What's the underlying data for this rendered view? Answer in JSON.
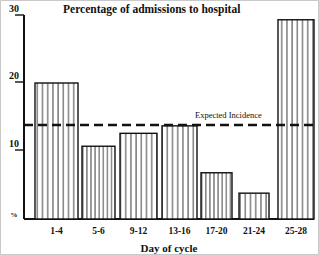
{
  "chart_data": {
    "type": "bar",
    "title": "Percentage of admissions to hospital",
    "xlabel": "Day of cycle",
    "ylabel": "%",
    "categories": [
      "1-4",
      "5-6",
      "9-12",
      "13-16",
      "17-20",
      "21-24",
      "25-28"
    ],
    "values": [
      20,
      10.7,
      12.6,
      13.7,
      6.8,
      3.8,
      29.3
    ],
    "ylim": [
      0,
      30
    ],
    "yticks": [
      0,
      10,
      20,
      30
    ],
    "ytick_labels": [
      "%",
      "10",
      "20",
      "30"
    ],
    "grid": false,
    "legend": "none",
    "annotations": [
      {
        "label": "Expected Incidence",
        "type": "horizontal-threshold-line",
        "value": 13.7,
        "style": "dashed"
      }
    ],
    "bar_style": "vertical-hatch-fill",
    "colors": {
      "ink": "#111111",
      "bar_fill": "#ffffff",
      "hatch": "#333333",
      "background": "#ffffff"
    }
  },
  "figure": {
    "title": "Percentage of admissions to hospital",
    "x_axis_title": "Day of cycle",
    "y_axis_unit": "%",
    "threshold_label": "Expected Incidence"
  }
}
